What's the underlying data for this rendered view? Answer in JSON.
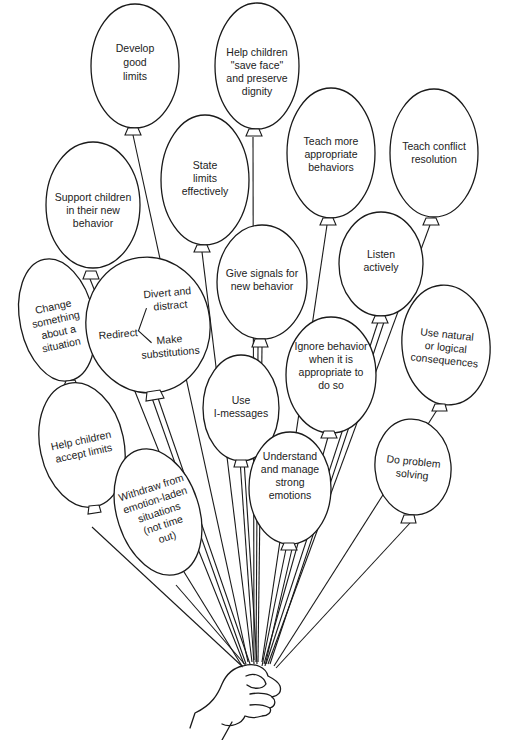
{
  "diagram": {
    "title": "",
    "colors": {
      "stroke": "#1a1a1a",
      "fill": "#ffffff",
      "text": "#222222"
    },
    "balloons": [
      {
        "id": "develop-good-limits",
        "lines": [
          "Develop",
          "good",
          "limits"
        ]
      },
      {
        "id": "help-save-face",
        "lines": [
          "Help children",
          "\"save face\"",
          "and preserve",
          "dignity"
        ]
      },
      {
        "id": "state-limits",
        "lines": [
          "State",
          "limits",
          "effectively"
        ]
      },
      {
        "id": "teach-appropriate",
        "lines": [
          "Teach more",
          "appropriate",
          "behaviors"
        ]
      },
      {
        "id": "teach-conflict",
        "lines": [
          "Teach conflict",
          "resolution"
        ]
      },
      {
        "id": "support-children",
        "lines": [
          "Support children",
          "in their new",
          "behavior"
        ]
      },
      {
        "id": "change-something",
        "lines": [
          "Change",
          "something",
          "about a",
          "situation"
        ]
      },
      {
        "id": "redirect",
        "main": "Redirect",
        "branches": [
          [
            "Divert and",
            "distract"
          ],
          [
            "Make",
            "substitutions"
          ]
        ]
      },
      {
        "id": "give-signals",
        "lines": [
          "Give signals for",
          "new behavior"
        ]
      },
      {
        "id": "listen-actively",
        "lines": [
          "Listen",
          "actively"
        ]
      },
      {
        "id": "ignore-behavior",
        "lines": [
          "Ignore behavior",
          "when it is",
          "appropriate to",
          "do so"
        ]
      },
      {
        "id": "natural-consequences",
        "lines": [
          "Use natural",
          "or logical",
          "consequences"
        ]
      },
      {
        "id": "i-messages",
        "lines": [
          "Use",
          "I-messages"
        ]
      },
      {
        "id": "accept-limits",
        "lines": [
          "Help children",
          "accept limits"
        ]
      },
      {
        "id": "withdraw",
        "lines": [
          "Withdraw from",
          "emotion-laden",
          "situations",
          "(not time",
          "out)"
        ]
      },
      {
        "id": "understand-emotions",
        "lines": [
          "Understand",
          "and manage",
          "strong",
          "emotions"
        ]
      },
      {
        "id": "problem-solving",
        "lines": [
          "Do problem",
          "solving"
        ]
      }
    ]
  }
}
